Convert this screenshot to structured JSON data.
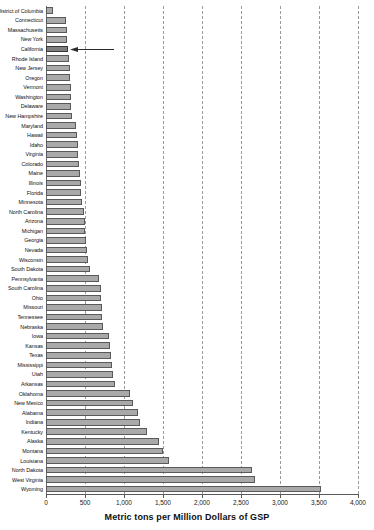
{
  "chart_data": {
    "type": "bar",
    "orientation": "horizontal",
    "title": "",
    "subtitle": "",
    "xlabel": "Metric tons per Million Dollars of GSP",
    "ylabel": "",
    "xlim": [
      0,
      4000
    ],
    "xticks": [
      0,
      500,
      1000,
      1500,
      2000,
      2500,
      3000,
      3500,
      4000
    ],
    "xtick_labels": [
      "0",
      "500",
      "1,000",
      "1,500",
      "2,000",
      "2,500",
      "3,000",
      "3,500",
      "4,000"
    ],
    "grid": "vertical-dashed",
    "legend": "none",
    "sort": "ascending",
    "categories": [
      "District of Columbia",
      "Connecticut",
      "Massachusetts",
      "New York",
      "California",
      "Rhode Island",
      "New Jersey",
      "Oregon",
      "Vermont",
      "Washington",
      "Delaware",
      "New Hampshire",
      "Maryland",
      "Hawaii",
      "Idaho",
      "Virginia",
      "Colorado",
      "Maine",
      "Illinois",
      "Florida",
      "Minnesota",
      "North Carolina",
      "Arizona",
      "Michigan",
      "Georgia",
      "Nevada",
      "Wisconsin",
      "South Dakota",
      "Pennsylvania",
      "South Carolina",
      "Ohio",
      "Missouri",
      "Tennessee",
      "Nebraska",
      "Iowa",
      "Kansas",
      "Texas",
      "Mississippi",
      "Utah",
      "Arkansas",
      "Oklahoma",
      "New Mexico",
      "Alabama",
      "Indiana",
      "Kentucky",
      "Alaska",
      "Montana",
      "Louisiana",
      "North Dakota",
      "West Virginia",
      "Wyoming"
    ],
    "values": [
      95,
      255,
      270,
      275,
      280,
      300,
      305,
      310,
      315,
      320,
      325,
      330,
      390,
      400,
      410,
      415,
      425,
      440,
      445,
      450,
      465,
      490,
      500,
      505,
      515,
      525,
      540,
      560,
      680,
      700,
      710,
      715,
      720,
      725,
      810,
      820,
      830,
      840,
      855,
      880,
      1080,
      1110,
      1180,
      1200,
      1290,
      1450,
      1500,
      1580,
      2640,
      2680,
      3520
    ],
    "highlighted_category": "California",
    "annotation": {
      "type": "arrow",
      "points_to": "California",
      "direction": "left",
      "label": ""
    }
  }
}
